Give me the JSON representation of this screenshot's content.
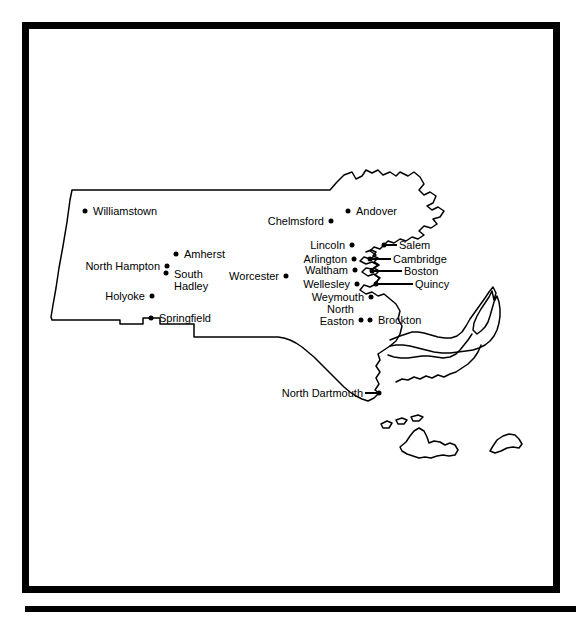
{
  "document": {
    "title": "Massachusetts Cities Map",
    "frame_color": "#000000",
    "background_color": "#ffffff",
    "line_color": "#000000"
  },
  "map": {
    "region": "Massachusetts",
    "style": "outline",
    "cities": [
      {
        "name": "Williamstown",
        "label": "Williamstown",
        "dot_x": 85,
        "dot_y": 211,
        "label_x": 93,
        "label_y": 211,
        "align": "right",
        "leader": false
      },
      {
        "name": "Chelmsford",
        "label": "Chelmsford",
        "dot_x": 331,
        "dot_y": 221,
        "label_x": 324,
        "label_y": 221,
        "align": "left",
        "leader": false
      },
      {
        "name": "Andover",
        "label": "Andover",
        "dot_x": 348,
        "dot_y": 211,
        "label_x": 356,
        "label_y": 211,
        "align": "right",
        "leader": false
      },
      {
        "name": "North Hampton",
        "label": "North Hampton",
        "dot_x": 167,
        "dot_y": 266,
        "label_x": 160,
        "label_y": 266,
        "align": "left",
        "leader": false
      },
      {
        "name": "Amherst",
        "label": "Amherst",
        "dot_x": 176,
        "dot_y": 254,
        "label_x": 184,
        "label_y": 254,
        "align": "right",
        "leader": false
      },
      {
        "name": "South Hadley",
        "label": "South\nHadley",
        "dot_x": 166,
        "dot_y": 273,
        "label_x": 174,
        "label_y": 280,
        "align": "right",
        "leader": false
      },
      {
        "name": "Holyoke",
        "label": "Holyoke",
        "dot_x": 152,
        "dot_y": 296,
        "label_x": 145,
        "label_y": 296,
        "align": "left",
        "leader": false
      },
      {
        "name": "Springfield",
        "label": "Springfield",
        "dot_x": 151,
        "dot_y": 318,
        "label_x": 159,
        "label_y": 318,
        "align": "right",
        "leader": false
      },
      {
        "name": "Worcester",
        "label": "Worcester",
        "dot_x": 286,
        "dot_y": 276,
        "label_x": 279,
        "label_y": 276,
        "align": "left",
        "leader": false
      },
      {
        "name": "Lincoln",
        "label": "Lincoln",
        "dot_x": 352,
        "dot_y": 245,
        "label_x": 345,
        "label_y": 245,
        "align": "left",
        "leader": false
      },
      {
        "name": "Arlington",
        "label": "Arlington",
        "dot_x": 354,
        "dot_y": 259,
        "label_x": 347,
        "label_y": 259,
        "align": "left",
        "leader": false
      },
      {
        "name": "Waltham",
        "label": "Waltham",
        "dot_x": 355,
        "dot_y": 270,
        "label_x": 348,
        "label_y": 270,
        "align": "left",
        "leader": false
      },
      {
        "name": "Wellesley",
        "label": "Wellesley",
        "dot_x": 357,
        "dot_y": 284,
        "label_x": 350,
        "label_y": 284,
        "align": "left",
        "leader": false
      },
      {
        "name": "Weymouth",
        "label": "Weymouth",
        "dot_x": 371,
        "dot_y": 297,
        "label_x": 364,
        "label_y": 297,
        "align": "left",
        "leader": false
      },
      {
        "name": "North Easton",
        "label": "North\nEaston",
        "dot_x": 361,
        "dot_y": 320,
        "label_x": 354,
        "label_y": 315,
        "align": "left",
        "leader": false
      },
      {
        "name": "Brockton",
        "label": "Brockton",
        "dot_x": 370,
        "dot_y": 320,
        "label_x": 378,
        "label_y": 320,
        "align": "right",
        "leader": false
      },
      {
        "name": "Salem",
        "label": "Salem",
        "dot_x": 384,
        "dot_y": 245,
        "label_x": 399,
        "label_y": 245,
        "align": "right",
        "leader": true,
        "leader_x1": 384,
        "leader_x2": 397
      },
      {
        "name": "Cambridge",
        "label": "Cambridge",
        "dot_x": 370,
        "dot_y": 259,
        "label_x": 393,
        "label_y": 259,
        "align": "right",
        "leader": true,
        "leader_x1": 368,
        "leader_x2": 391
      },
      {
        "name": "Boston",
        "label": "Boston",
        "dot_x": 372,
        "dot_y": 271,
        "label_x": 404,
        "label_y": 271,
        "align": "right",
        "leader": true,
        "leader_x1": 370,
        "leader_x2": 402
      },
      {
        "name": "Quincy",
        "label": "Quincy",
        "dot_x": 376,
        "dot_y": 284,
        "label_x": 415,
        "label_y": 284,
        "align": "right",
        "leader": true,
        "leader_x1": 374,
        "leader_x2": 413
      },
      {
        "name": "North Dartmouth",
        "label": "North Dartmouth",
        "dot_x": 379,
        "dot_y": 393,
        "label_x": 363,
        "label_y": 393,
        "align": "left",
        "leader": true,
        "leader_x1": 365,
        "leader_x2": 379
      }
    ]
  }
}
